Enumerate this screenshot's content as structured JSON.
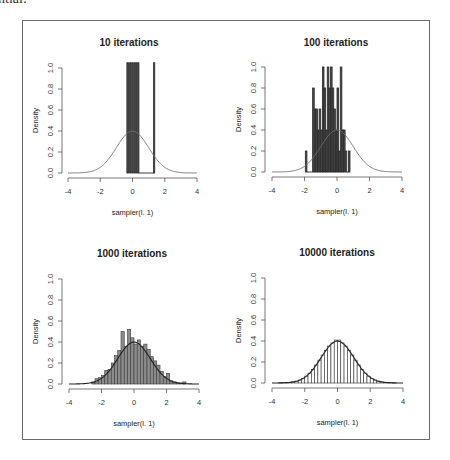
{
  "page": {
    "cut_text": "ntial:"
  },
  "colors": {
    "bar_fill_dark": "#4a4a4a",
    "bar_fill_mid": "#8c8c8c",
    "bar_stroke": "#2a2a2a",
    "curve": "#707070",
    "curve_dark": "#222222",
    "axis": "#555555",
    "text": "#222222"
  },
  "chart_data": [
    {
      "type": "bar",
      "subtype": "histogram_with_density_curve",
      "title": "10 iterations",
      "xlabel": "sampler(l. 1)",
      "ylabel": "Density",
      "xlim": [
        -4,
        4
      ],
      "ylim": [
        0,
        1.0
      ],
      "xticks": [
        "-4",
        "-2",
        "0",
        "2",
        "4"
      ],
      "yticks": [
        "0.0",
        "0.2",
        "0.4",
        "0.6",
        "0.8",
        "1.0"
      ],
      "grid": false,
      "bins": [
        {
          "x0": -0.35,
          "x1": -0.25,
          "density": 1.05
        },
        {
          "x0": -0.2,
          "x1": -0.1,
          "density": 1.05
        },
        {
          "x0": -0.05,
          "x1": 0.05,
          "density": 1.05
        },
        {
          "x0": 0.1,
          "x1": 0.2,
          "density": 1.05
        },
        {
          "x0": 0.25,
          "x1": 0.4,
          "density": 1.05
        },
        {
          "x0": 0.4,
          "x1": 1.3,
          "density": 0.0
        },
        {
          "x0": 1.3,
          "x1": 1.38,
          "density": 1.05
        }
      ],
      "curve": "standard normal density N(0,1), peak 0.4"
    },
    {
      "type": "bar",
      "subtype": "histogram_with_density_curve",
      "title": "100 iterations",
      "xlabel": "sampler(l. 1)",
      "ylabel": "Density",
      "xlim": [
        -4,
        4
      ],
      "ylim": [
        0,
        1.0
      ],
      "xticks": [
        "-4",
        "-2",
        "0",
        "2",
        "4"
      ],
      "yticks": [
        "0.0",
        "0.2",
        "0.4",
        "0.6",
        "0.8",
        "1.0"
      ],
      "grid": false,
      "bins": [
        {
          "x0": -1.95,
          "x1": -1.85,
          "density": 0.2
        },
        {
          "x0": -1.85,
          "x1": -1.5,
          "density": 0.0
        },
        {
          "x0": -1.5,
          "x1": -1.4,
          "density": 0.8
        },
        {
          "x0": -1.4,
          "x1": -1.3,
          "density": 0.6
        },
        {
          "x0": -1.3,
          "x1": -1.2,
          "density": 0.6
        },
        {
          "x0": -1.2,
          "x1": -1.1,
          "density": 0.4
        },
        {
          "x0": -1.1,
          "x1": -1.0,
          "density": 0.6
        },
        {
          "x0": -1.0,
          "x1": -0.9,
          "density": 0.4
        },
        {
          "x0": -0.9,
          "x1": -0.8,
          "density": 1.0
        },
        {
          "x0": -0.8,
          "x1": -0.7,
          "density": 0.8
        },
        {
          "x0": -0.7,
          "x1": -0.6,
          "density": 0.4
        },
        {
          "x0": -0.6,
          "x1": -0.5,
          "density": 1.0
        },
        {
          "x0": -0.5,
          "x1": -0.4,
          "density": 0.8
        },
        {
          "x0": -0.4,
          "x1": -0.3,
          "density": 1.0
        },
        {
          "x0": -0.3,
          "x1": -0.2,
          "density": 0.8
        },
        {
          "x0": -0.2,
          "x1": -0.1,
          "density": 0.6
        },
        {
          "x0": -0.1,
          "x1": 0.0,
          "density": 0.4
        },
        {
          "x0": 0.0,
          "x1": 0.1,
          "density": 0.8
        },
        {
          "x0": 0.1,
          "x1": 0.2,
          "density": 0.2
        },
        {
          "x0": 0.2,
          "x1": 0.3,
          "density": 1.0
        },
        {
          "x0": 0.3,
          "x1": 0.4,
          "density": 0.4
        },
        {
          "x0": 0.4,
          "x1": 0.5,
          "density": 0.4
        },
        {
          "x0": 0.5,
          "x1": 0.6,
          "density": 0.2
        },
        {
          "x0": 0.6,
          "x1": 0.7,
          "density": 0.0
        },
        {
          "x0": 0.7,
          "x1": 0.8,
          "density": 0.2
        }
      ],
      "curve": "standard normal density N(0,1), peak 0.4"
    },
    {
      "type": "bar",
      "subtype": "histogram_with_density_curve",
      "title": "1000 iterations",
      "xlabel": "sampler(l. 1)",
      "ylabel": "Density",
      "xlim": [
        -4,
        4
      ],
      "ylim": [
        0,
        1.0
      ],
      "xticks": [
        "-4",
        "-2",
        "0",
        "2",
        "4"
      ],
      "yticks": [
        "0.0",
        "0.2",
        "0.4",
        "0.6",
        "0.8",
        "1.0"
      ],
      "grid": false,
      "bins": [
        {
          "x0": -2.6,
          "x1": -2.4,
          "density": 0.02
        },
        {
          "x0": -2.4,
          "x1": -2.2,
          "density": 0.05
        },
        {
          "x0": -2.2,
          "x1": -2.0,
          "density": 0.06
        },
        {
          "x0": -2.0,
          "x1": -1.8,
          "density": 0.08
        },
        {
          "x0": -1.8,
          "x1": -1.6,
          "density": 0.13
        },
        {
          "x0": -1.6,
          "x1": -1.4,
          "density": 0.14
        },
        {
          "x0": -1.4,
          "x1": -1.2,
          "density": 0.2
        },
        {
          "x0": -1.2,
          "x1": -1.0,
          "density": 0.27
        },
        {
          "x0": -1.0,
          "x1": -0.8,
          "density": 0.32
        },
        {
          "x0": -0.8,
          "x1": -0.6,
          "density": 0.5
        },
        {
          "x0": -0.6,
          "x1": -0.4,
          "density": 0.36
        },
        {
          "x0": -0.4,
          "x1": -0.2,
          "density": 0.52
        },
        {
          "x0": -0.2,
          "x1": 0.0,
          "density": 0.44
        },
        {
          "x0": 0.0,
          "x1": 0.2,
          "density": 0.38
        },
        {
          "x0": 0.2,
          "x1": 0.4,
          "density": 0.42
        },
        {
          "x0": 0.4,
          "x1": 0.6,
          "density": 0.36
        },
        {
          "x0": 0.6,
          "x1": 0.8,
          "density": 0.38
        },
        {
          "x0": 0.8,
          "x1": 1.0,
          "density": 0.33
        },
        {
          "x0": 1.0,
          "x1": 1.2,
          "density": 0.26
        },
        {
          "x0": 1.2,
          "x1": 1.4,
          "density": 0.22
        },
        {
          "x0": 1.4,
          "x1": 1.6,
          "density": 0.18
        },
        {
          "x0": 1.6,
          "x1": 1.8,
          "density": 0.12
        },
        {
          "x0": 1.8,
          "x1": 2.0,
          "density": 0.07
        },
        {
          "x0": 2.0,
          "x1": 2.2,
          "density": 0.1
        },
        {
          "x0": 2.2,
          "x1": 2.4,
          "density": 0.03
        },
        {
          "x0": 2.4,
          "x1": 2.6,
          "density": 0.02
        },
        {
          "x0": 2.6,
          "x1": 2.8,
          "density": 0.01
        },
        {
          "x0": 2.8,
          "x1": 3.0,
          "density": 0.01
        },
        {
          "x0": 3.0,
          "x1": 3.2,
          "density": 0.02
        }
      ],
      "curve": "standard normal density N(0,1), peak 0.4"
    },
    {
      "type": "bar",
      "subtype": "histogram_with_density_curve",
      "title": "10000 iterations",
      "xlabel": "sampler(l. 1)",
      "ylabel": "Density",
      "xlim": [
        -4,
        4
      ],
      "ylim": [
        0,
        1.0
      ],
      "xticks": [
        "-4",
        "-2",
        "0",
        "2",
        "4"
      ],
      "yticks": [
        "0.0",
        "0.2",
        "0.4",
        "0.6",
        "0.8",
        "1.0"
      ],
      "grid": false,
      "bin_width": 0.2,
      "bin_range": [
        -3.6,
        3.6
      ],
      "bins_follow": "standard normal density, max ~0.41 at x=0",
      "curve": "standard normal density N(0,1), peak 0.4"
    }
  ]
}
